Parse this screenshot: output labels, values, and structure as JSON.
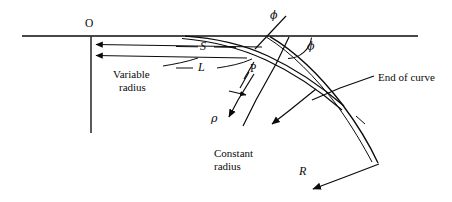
{
  "figure": {
    "type": "engineering-geometry-diagram",
    "background_color": "#ffffff",
    "line_color": "#0b0b0b",
    "width": 452,
    "height": 202
  },
  "labels": {
    "origin": "O",
    "point_p": "P",
    "spiral_length_s": "S",
    "tangent_length_l": "L",
    "variable_radius": "Variable\nradius",
    "variable_radius_line1": "Variable",
    "variable_radius_line2": "radius",
    "constant_radius_line1": "Constant",
    "constant_radius_line2": "radius",
    "end_of_curve": "End of curve",
    "phi_upper": "ϕ",
    "phi_lower": "ϕ",
    "rho": "ρ",
    "radius_r": "R"
  },
  "geometry": {
    "tangent_line": {
      "x1": 22,
      "y1": 36,
      "x2": 418,
      "y2": 36
    },
    "vertical_offset_line": {
      "x1": 91,
      "y1": 36,
      "x2": 91,
      "y2": 133
    },
    "dimension_s": {
      "from_x": 260,
      "from_y": 46,
      "to_x": 94,
      "to_y": 44
    },
    "dimension_l": {
      "from_x": 258,
      "from_y": 58,
      "to_x": 94,
      "to_y": 55
    },
    "spiral_curve": "starts at tangent near x=185 and curves down-right through P to end of curve",
    "circular_arc": "continues from end of spiral down to lower right",
    "angle_arc_phi": {
      "vertex_x": 288,
      "vertex_y": 37,
      "radius": 26
    }
  },
  "colors": {
    "ink": "#0b0b0b",
    "paper": "#ffffff"
  }
}
